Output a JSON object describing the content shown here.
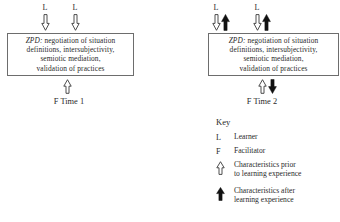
{
  "figure": {
    "zpd_prefix": "ZPD:",
    "zpd_body": " negotiation of situation\ndefinitions, intersubjectivity,\nsemiotic mediation,\nvalidation of practices"
  },
  "time1": {
    "caption": "F Time 1",
    "learner_top_left": "L",
    "learner_top_right": "L",
    "zpd_prefix": "ZPD:",
    "zpd_body": " negotiation of situation\ndefinitions, intersubjectivity,\nsemiotic mediation,\nvalidation of practices"
  },
  "time2": {
    "caption": "F Time 2",
    "learner_top_left": "L",
    "learner_top_right": "L",
    "zpd_prefix": "ZPD:",
    "zpd_body": " negotiation of situation\ndefinitions, intersubjectivity,\nsemiotic mediation,\nvalidation of practices"
  },
  "key": {
    "title": "Key",
    "rows": [
      {
        "symbol": "L",
        "symbol_type": "letter",
        "description": "Learner"
      },
      {
        "symbol": "F",
        "symbol_type": "letter",
        "description": "Facilitator"
      },
      {
        "symbol": "hollow-up-arrow",
        "symbol_type": "arrow-hollow-up",
        "description": "Characteristics prior\nto learning experience"
      },
      {
        "symbol": "filled-up-arrow",
        "symbol_type": "arrow-filled-up",
        "description": "Characteristics after\nlearning experience"
      }
    ]
  },
  "colors": {
    "ink": "#2a2a2a",
    "box_border": "#6d6d6d",
    "arrow_outline": "#3a3a3a",
    "arrow_fill_solid": "#111111",
    "background": "#ffffff"
  }
}
